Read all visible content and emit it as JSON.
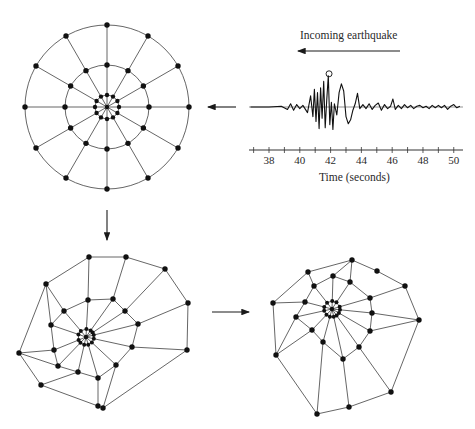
{
  "figure": {
    "title": "Incoming earthquake",
    "colors": {
      "ink": "#1a1a1a",
      "line": "#555555",
      "node": "#111111",
      "background": "#ffffff"
    }
  },
  "chart_data": {
    "type": "line",
    "title": "Incoming earthquake",
    "xlabel": "Time (seconds)",
    "ylabel": "",
    "xlim": [
      36.7,
      50.6
    ],
    "x_ticks": [
      38,
      40,
      42,
      44,
      46,
      48,
      50
    ],
    "minor_ticks_every": 1,
    "annotation": {
      "type": "circled-peak",
      "x": 41.9,
      "label": ""
    },
    "series": [
      {
        "name": "seismogram",
        "x": [
          36.8,
          38.0,
          38.8,
          39.2,
          39.4,
          39.6,
          39.8,
          40.0,
          40.2,
          40.5,
          40.7,
          40.85,
          40.95,
          41.05,
          41.15,
          41.25,
          41.35,
          41.45,
          41.55,
          41.65,
          41.75,
          41.85,
          41.95,
          42.05,
          42.15,
          42.25,
          42.4,
          42.55,
          42.7,
          42.85,
          43.0,
          43.15,
          43.3,
          43.45,
          43.6,
          43.75,
          43.9,
          44.1,
          44.3,
          44.5,
          44.7,
          44.9,
          45.1,
          45.3,
          45.5,
          45.7,
          45.9,
          46.05,
          46.2,
          46.4,
          46.6,
          46.8,
          47.0,
          47.2,
          47.4,
          47.6,
          47.8,
          48.0,
          48.2,
          48.4,
          48.6,
          48.8,
          49.0,
          49.2,
          49.4,
          49.6,
          49.8,
          50.0,
          50.2,
          50.4
        ],
        "y": [
          0,
          0,
          0.05,
          -0.15,
          0.2,
          -0.2,
          0.15,
          -0.1,
          0.1,
          -0.35,
          0.7,
          -0.6,
          1.1,
          -0.9,
          0.9,
          -1.35,
          1.2,
          -0.7,
          1.6,
          -1.3,
          0.4,
          1.95,
          -1.1,
          0.3,
          -1.4,
          0.2,
          -0.5,
          0.9,
          1.45,
          1.0,
          -0.6,
          -1.05,
          -0.8,
          -0.2,
          0.2,
          0.85,
          -0.1,
          0.15,
          -0.1,
          0.2,
          -0.15,
          0.1,
          0.25,
          -0.2,
          0.15,
          -0.1,
          0.05,
          0.5,
          -0.15,
          0.1,
          -0.1,
          0.15,
          -0.05,
          0.1,
          -0.1,
          0.05,
          0.1,
          -0.05,
          0.05,
          -0.1,
          0.1,
          -0.05,
          0.1,
          -0.05,
          0.1,
          -0.15,
          0.05,
          0.15,
          -0.05,
          0.05
        ]
      }
    ]
  },
  "panels": {
    "original_web": {
      "label": "Undeformed spiral web (circular)",
      "center": [
        107,
        107
      ],
      "spokes": 12,
      "ring_radii": [
        12,
        42,
        82
      ]
    },
    "deformed_web_1": {
      "label": "Deformed web (first distortion)",
      "center": [
        86,
        337
      ],
      "inner_radius": 8,
      "middle_nodes": [
        [
          88,
          300
        ],
        [
          113,
          299
        ],
        [
          125,
          311
        ],
        [
          138,
          324
        ],
        [
          132,
          347
        ],
        [
          116,
          365
        ],
        [
          98,
          378
        ],
        [
          78,
          372
        ],
        [
          58,
          366
        ],
        [
          54,
          350
        ],
        [
          51,
          325
        ],
        [
          64,
          311
        ]
      ],
      "outer_nodes": [
        [
          89,
          257
        ],
        [
          126,
          257
        ],
        [
          165,
          269
        ],
        [
          188,
          303
        ],
        [
          187,
          350
        ],
        [
          103,
          408
        ],
        [
          98,
          406
        ],
        [
          41,
          385
        ],
        [
          19,
          353
        ],
        [
          46,
          284
        ]
      ],
      "spoke_outer_map": [
        0,
        1,
        2,
        3,
        4,
        5,
        6,
        7,
        8,
        8,
        9,
        9
      ]
    },
    "deformed_web_2": {
      "label": "Deformed web (second distortion)",
      "center": [
        332,
        309
      ],
      "inner_radius": 8,
      "middle_nodes": [
        [
          333,
          276
        ],
        [
          350,
          282
        ],
        [
          370,
          298
        ],
        [
          372,
          313
        ],
        [
          370,
          331
        ],
        [
          359,
          347
        ],
        [
          343,
          359
        ],
        [
          323,
          342
        ],
        [
          312,
          330
        ],
        [
          296,
          317
        ],
        [
          305,
          302
        ],
        [
          314,
          286
        ]
      ],
      "outer_nodes": [
        [
          352,
          260
        ],
        [
          377,
          271
        ],
        [
          405,
          286
        ],
        [
          419,
          320
        ],
        [
          391,
          392
        ],
        [
          349,
          407
        ],
        [
          317,
          414
        ],
        [
          276,
          355
        ],
        [
          273,
          303
        ],
        [
          308,
          272
        ]
      ],
      "spoke_outer_map": [
        0,
        0,
        2,
        3,
        3,
        4,
        5,
        6,
        7,
        7,
        8,
        9
      ]
    }
  },
  "arrows": [
    {
      "name": "earthquake-direction",
      "from": [
        400,
        51
      ],
      "to": [
        298,
        51
      ]
    },
    {
      "name": "to-original-web",
      "from": [
        236,
        107
      ],
      "to": [
        208,
        107
      ]
    },
    {
      "name": "to-deformed-web-1",
      "from": [
        107,
        210
      ],
      "to": [
        107,
        240
      ]
    },
    {
      "name": "to-deformed-web-2",
      "from": [
        212,
        312
      ],
      "to": [
        249,
        312
      ]
    }
  ]
}
